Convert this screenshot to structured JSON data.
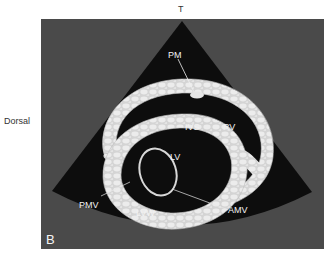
{
  "orientation": {
    "top": "T",
    "left": "Dorsal"
  },
  "panel": {
    "letter": "B",
    "background": "#4a4a4a",
    "sector_color": "#0d0d0d",
    "tissue_color": "#d9d9d9"
  },
  "labels": {
    "pm": "PM",
    "ivs": "IVS",
    "rv": "RV",
    "lv": "LV",
    "pmv": "PMV",
    "lvw": "LVW",
    "amv": "AMV"
  }
}
